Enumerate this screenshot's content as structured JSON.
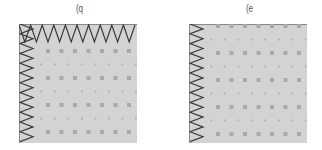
{
  "panels": [
    {
      "id": "left",
      "label": "(q",
      "x": 19,
      "background": "#d3d3d3",
      "grid": {
        "large_rows": [
          0.5,
          2.5,
          4.5,
          6.5
        ],
        "cols": 8
      },
      "zigzag_top": true,
      "zigzag_left": true
    },
    {
      "id": "right",
      "label": "(e",
      "x": 189,
      "background": "#d3d3d3",
      "grid": {
        "cols": 8
      },
      "zigzag_top": false,
      "zigzag_left": true
    }
  ],
  "colors": {
    "panel_fill": "#d3d3d3",
    "large_dot": "#aaaaaa",
    "small_dot": "#b4b4b4",
    "zigzag": "#3a3a3a",
    "border": "#888888"
  }
}
